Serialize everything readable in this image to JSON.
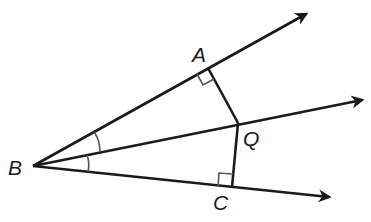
{
  "diagram": {
    "type": "geometry",
    "points": {
      "B": {
        "label": "B",
        "x": 33,
        "y": 166
      },
      "A": {
        "label": "A",
        "x": 208,
        "y": 68
      },
      "Q": {
        "label": "Q",
        "x": 238,
        "y": 123
      },
      "C": {
        "label": "C",
        "x": 232,
        "y": 187
      }
    },
    "rays": [
      {
        "name": "BA",
        "from": "B",
        "through": "A",
        "tip": [
          310,
          11
        ]
      },
      {
        "name": "BQ",
        "from": "B",
        "through": "Q",
        "tip": [
          366,
          99
        ]
      },
      {
        "name": "BC",
        "from": "B",
        "through": "C",
        "tip": [
          333,
          198
        ]
      }
    ],
    "segments": [
      {
        "name": "QA",
        "from": "Q",
        "to": "A"
      },
      {
        "name": "QC",
        "from": "Q",
        "to": "C"
      }
    ],
    "right_angles": [
      "A",
      "C"
    ],
    "congruent_angles": [
      "ABQ",
      "QBC"
    ],
    "colors": {
      "stroke": "#1a1a1a",
      "marks": "#555555",
      "background": "#ffffff"
    }
  }
}
